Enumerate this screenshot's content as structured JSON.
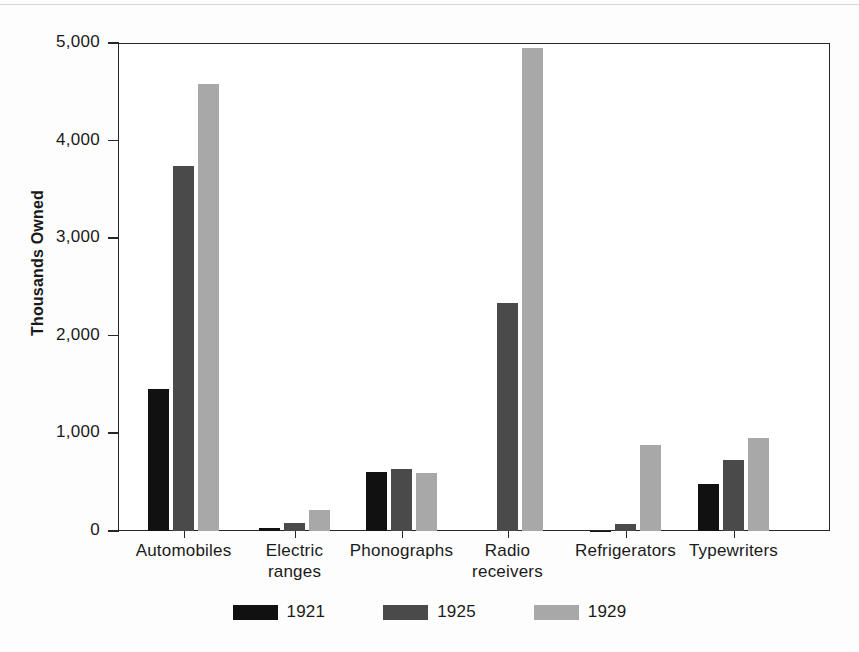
{
  "chart_data": {
    "type": "bar",
    "title": "",
    "subtitle": "",
    "xlabel": "",
    "ylabel": "Thousands Owned",
    "ylim": [
      0,
      5000
    ],
    "yticks": [
      0,
      1000,
      2000,
      3000,
      4000,
      5000
    ],
    "ytick_labels": [
      "0",
      "1,000",
      "2,000",
      "3,000",
      "4,000",
      "5,000"
    ],
    "grid": false,
    "legend_position": "bottom",
    "categories": [
      "Automobiles",
      "Electric\nranges",
      "Phonographs",
      "Radio\nreceivers",
      "Refrigerators",
      "Typewriters"
    ],
    "series": [
      {
        "name": "1921",
        "color": "#111111",
        "values": [
          1450,
          30,
          600,
          0,
          5,
          480
        ]
      },
      {
        "name": "1925",
        "color": "#4a4a4a",
        "values": [
          3740,
          80,
          640,
          2340,
          75,
          730
        ]
      },
      {
        "name": "1929",
        "color": "#a8a8a8",
        "values": [
          4580,
          220,
          590,
          4950,
          880,
          950
        ]
      }
    ]
  },
  "legend": {
    "items": [
      {
        "label": "1921",
        "color": "#111111"
      },
      {
        "label": "1925",
        "color": "#4a4a4a"
      },
      {
        "label": "1929",
        "color": "#a8a8a8"
      }
    ]
  },
  "axis": {
    "y_title": "Thousands Owned"
  },
  "style": {
    "frame_color": "#262626",
    "background": "#ffffff",
    "text_color": "#1a1a1a"
  }
}
